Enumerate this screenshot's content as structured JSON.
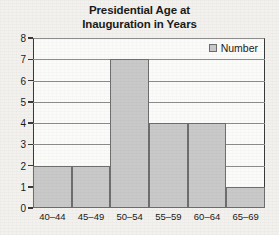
{
  "chart_data": {
    "type": "bar",
    "title": "Presidential Age at Inauguration in Years",
    "title_lines": [
      "Presidential Age at",
      "Inauguration in Years"
    ],
    "categories": [
      "40–44",
      "45–49",
      "50–54",
      "55–59",
      "60–64",
      "65–69"
    ],
    "values": [
      2,
      2,
      7,
      4,
      4,
      1
    ],
    "series": [
      {
        "name": "Number",
        "values": [
          2,
          2,
          7,
          4,
          4,
          1
        ]
      }
    ],
    "xlabel": "",
    "ylabel": "",
    "ylim": [
      0,
      8
    ],
    "yticks": [
      0,
      1,
      2,
      3,
      4,
      5,
      6,
      7,
      8
    ],
    "ytick_labels": [
      "0",
      "1",
      "2",
      "3",
      "4",
      "5",
      "6",
      "7",
      "8"
    ],
    "grid": true,
    "legend": {
      "position": "top-right",
      "entries": [
        "Number"
      ]
    },
    "colors": {
      "bar_fill": "#c9c9c9",
      "bar_border": "#6e6e6e",
      "axis": "#3a3a3a",
      "grid": "#8d8d8d",
      "background": "#f2f1ee",
      "plot_background": "#fbfbfa",
      "text": "#1a1a1a"
    }
  }
}
